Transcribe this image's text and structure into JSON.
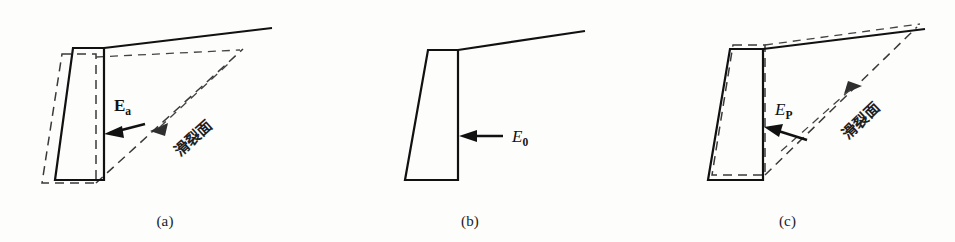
{
  "figure": {
    "background_color": "#fdfdfc",
    "line_color": "#111111",
    "dashed_color": "#3a3a3a"
  },
  "panels": [
    {
      "id": "a",
      "caption": "(a)",
      "state": "active",
      "force_label_main": "E",
      "force_label_sub": "a",
      "slip_label": "滑裂面",
      "slip_arrow_direction": "down-left",
      "wall_displacement": "away-from-backfill",
      "has_dashed_original_outline": true,
      "has_slip_surface": true
    },
    {
      "id": "b",
      "caption": "(b)",
      "state": "at-rest",
      "force_label_main": "E",
      "force_label_sub": "0",
      "slip_label": "",
      "slip_arrow_direction": "",
      "wall_displacement": "none",
      "has_dashed_original_outline": false,
      "has_slip_surface": false
    },
    {
      "id": "c",
      "caption": "(c)",
      "state": "passive",
      "force_label_main": "E",
      "force_label_sub": "P",
      "slip_label": "滑裂面",
      "slip_arrow_direction": "up-right",
      "wall_displacement": "into-backfill",
      "has_dashed_original_outline": true,
      "has_slip_surface": true
    }
  ]
}
